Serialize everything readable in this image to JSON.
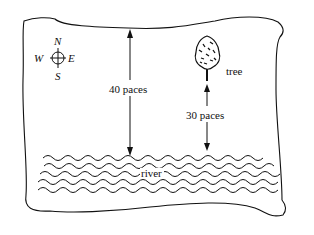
{
  "diagram": {
    "compass": {
      "north": "N",
      "south": "S",
      "east": "E",
      "west": "W"
    },
    "tree_label": "tree",
    "river_label": "river",
    "distance_river_to_top": "40 paces",
    "distance_river_to_tree": "30 paces"
  }
}
